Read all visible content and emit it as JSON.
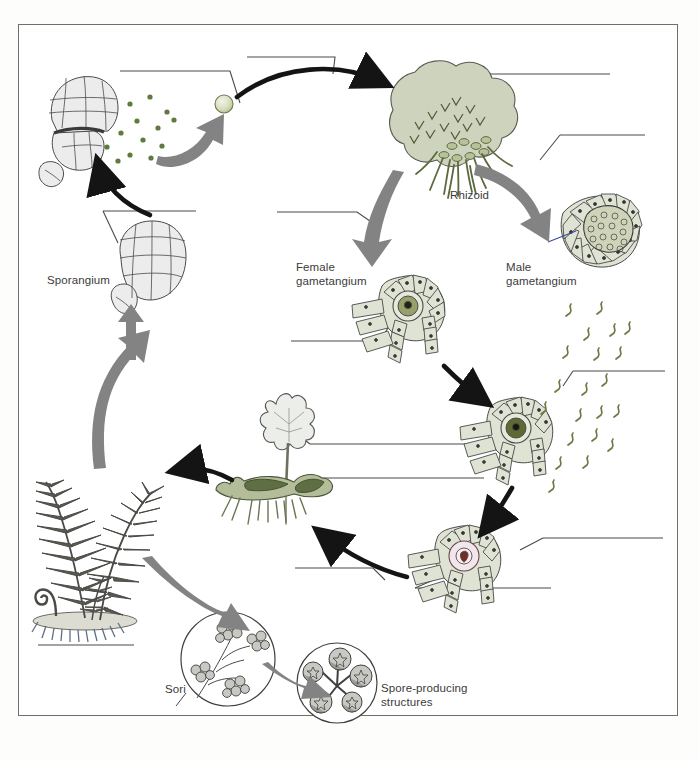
{
  "figure": {
    "type": "biology-life-cycle-diagram",
    "organism": "Fern"
  },
  "labels": {
    "sporangium": "Sporangium",
    "rhizoid": "Rhizoid",
    "female_gametangium": "Female\ngametangium",
    "male_gametangium": "Male\ngametangium",
    "sori": "Sori",
    "spore_producing_structures": "Spore-producing\nstructures"
  },
  "blank_lines": [
    {
      "id": "blank-spore",
      "note": "leader from released spore, upper left"
    },
    {
      "id": "blank-gametophyte-top",
      "note": "leader from prothallus top right"
    },
    {
      "id": "blank-germinating-spore",
      "note": "leader to gray arrow, right upper"
    },
    {
      "id": "blank-sporangium-cluster",
      "note": "leader near sporangium, left middle"
    },
    {
      "id": "blank-antheridium-arrow",
      "note": "leader from gray arrow toward female gametangium"
    },
    {
      "id": "blank-egg",
      "note": "leader into female gametangium interior"
    },
    {
      "id": "blank-sperm",
      "note": "leader near sperm cells, right"
    },
    {
      "id": "blank-fertilization",
      "note": "leader to fertilization arrow, right lower"
    },
    {
      "id": "blank-zygote",
      "note": "leader into zygote interior, lower right"
    },
    {
      "id": "blank-young-sporophyte-leaf",
      "note": "leader from young frond"
    },
    {
      "id": "blank-gametophyte-mid",
      "note": "leader from gametophyte thallus"
    },
    {
      "id": "blank-embryo-arrow",
      "note": "leader under young sporophyte"
    },
    {
      "id": "blank-mature-sporophyte",
      "note": "line under adult fern, lower left"
    }
  ],
  "colors": {
    "prothallus_green": "#cdd3bc",
    "thallus_dark_green": "#5f6f43",
    "cell_fill": "#dfe3d3",
    "egg_green": "#97a06a",
    "zygote_red": "#7a2b28",
    "gray_arrow": "#808080",
    "black_arrow": "#141414",
    "sporangium_gray": "#e3e3e3",
    "fern_dark": "#4a4a46",
    "spore_dot": "#5f7a3c",
    "frame_border": "#6d6f6e",
    "line_color": "#4a4a4a",
    "text_color": "#3b3b3b"
  }
}
